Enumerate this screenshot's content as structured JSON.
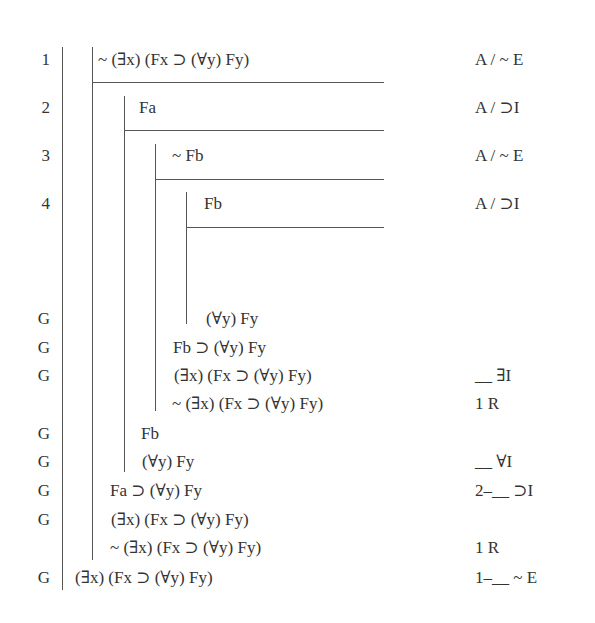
{
  "proof": {
    "rows": [
      {
        "label": "1",
        "formula": "~ (∃x) (Fx ⊃ (∀y) Fy)",
        "justification": "A / ~ E"
      },
      {
        "label": "2",
        "formula": "Fa",
        "justification": "A / ⊃I"
      },
      {
        "label": "3",
        "formula": "~ Fb",
        "justification": "A / ~ E"
      },
      {
        "label": "4",
        "formula": "Fb",
        "justification": "A / ⊃I"
      },
      {
        "label": "G",
        "formula": "(∀y) Fy",
        "justification": ""
      },
      {
        "label": "G",
        "formula": "Fb ⊃ (∀y) Fy",
        "justification": ""
      },
      {
        "label": "G",
        "formula": "(∃x) (Fx ⊃ (∀y) Fy)",
        "justification": "__ ∃I"
      },
      {
        "label": "",
        "formula": "~ (∃x) (Fx ⊃ (∀y) Fy)",
        "justification": "1 R"
      },
      {
        "label": "G",
        "formula": "Fb",
        "justification": ""
      },
      {
        "label": "G",
        "formula": "(∀y) Fy",
        "justification": "__ ∀I"
      },
      {
        "label": "G",
        "formula": "Fa ⊃ (∀y) Fy",
        "justification": "2–__ ⊃I"
      },
      {
        "label": "G",
        "formula": "(∃x) (Fx ⊃ (∀y) Fy)",
        "justification": ""
      },
      {
        "label": "",
        "formula": "~ (∃x) (Fx ⊃ (∀y) Fy)",
        "justification": "1 R"
      },
      {
        "label": "G",
        "formula": "(∃x) (Fx ⊃ (∀y) Fy)",
        "justification": "1–__ ~ E"
      }
    ]
  }
}
